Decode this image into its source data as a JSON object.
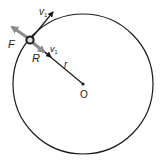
{
  "diagram": {
    "type": "circular-motion",
    "labels": {
      "velocity_top": "v",
      "velocity_top_sub": "1",
      "force": "F",
      "reaction": "R",
      "velocity_radial": "v",
      "velocity_radial_sub": "1",
      "radius": "r",
      "center": "O"
    },
    "colors": {
      "line": "#1a1a1a",
      "force_arrow": "#8c8c8c",
      "background": "#ffffff"
    }
  }
}
